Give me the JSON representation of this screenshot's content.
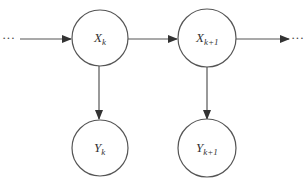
{
  "diagram": {
    "type": "hidden-markov-model",
    "nodes": [
      {
        "id": "xk",
        "base": "X",
        "sub": "k",
        "row": "hidden",
        "cx": 100,
        "cy": 37,
        "r": 28
      },
      {
        "id": "xk1",
        "base": "X",
        "sub": "k+1",
        "row": "hidden",
        "cx": 207,
        "cy": 37,
        "r": 29
      },
      {
        "id": "yk",
        "base": "Y",
        "sub": "k",
        "row": "observed",
        "cx": 100,
        "cy": 148,
        "r": 28
      },
      {
        "id": "yk1",
        "base": "Y",
        "sub": "k+1",
        "row": "observed",
        "cx": 207,
        "cy": 148,
        "r": 29
      }
    ],
    "edges": [
      {
        "from": "prev",
        "to": "xk"
      },
      {
        "from": "xk",
        "to": "xk1"
      },
      {
        "from": "xk1",
        "to": "next"
      },
      {
        "from": "xk",
        "to": "yk"
      },
      {
        "from": "xk1",
        "to": "yk1"
      }
    ],
    "ellipsis_left": "···",
    "ellipsis_right": "···",
    "colors": {
      "stroke": "#555555",
      "text": "#333333",
      "background": "#ffffff"
    }
  }
}
